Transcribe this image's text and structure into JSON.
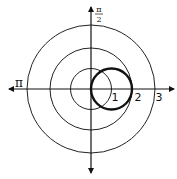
{
  "figure": {
    "type": "polar-graph",
    "colors": {
      "line": "#111111",
      "background": "#ffffff"
    },
    "grid_circles": [
      1,
      2,
      3
    ],
    "angle_labels": {
      "pi_over_2": {
        "numerator": "π",
        "denominator": "2"
      },
      "pi": "π"
    },
    "radius_labels": [
      "1",
      "2",
      "3"
    ],
    "curve": {
      "equation": "r = 2cos(θ)",
      "center_r": 1,
      "center_theta": 0,
      "radius": 1
    }
  }
}
